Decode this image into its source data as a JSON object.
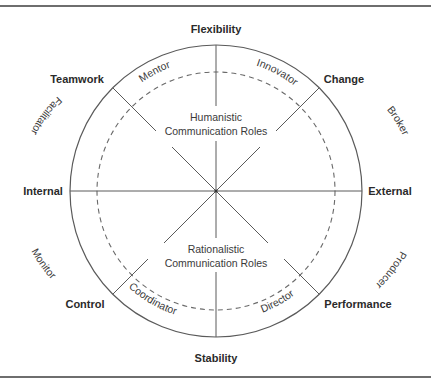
{
  "diagram": {
    "axes": {
      "top": "Flexibility",
      "bottom": "Stability",
      "left": "Internal",
      "right": "External",
      "top_left": "Teamwork",
      "top_right": "Change",
      "bottom_left": "Control",
      "bottom_right": "Performance"
    },
    "roles": {
      "mentor": "Mentor",
      "innovator": "Innovator",
      "broker": "Broker",
      "producer": "Producer",
      "director": "Director",
      "coordinator": "Coordinator",
      "monitor": "Monitor",
      "facilitator": "Facilitator"
    },
    "groups": {
      "upper": {
        "line1": "Humanistic",
        "line2": "Communication Roles"
      },
      "lower": {
        "line1": "Rationalistic",
        "line2": "Communication Roles"
      }
    }
  }
}
